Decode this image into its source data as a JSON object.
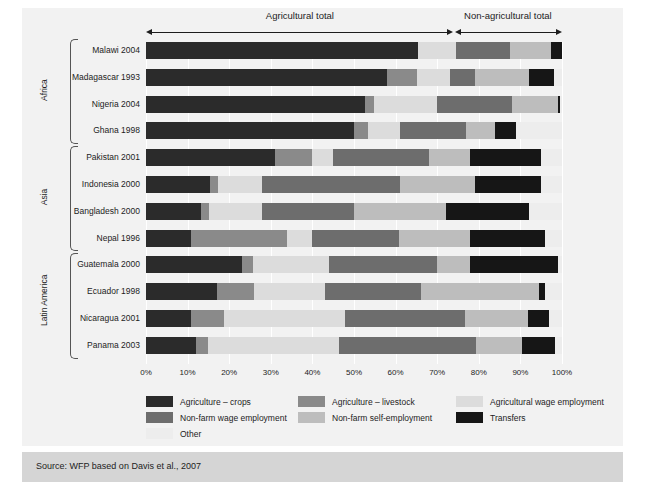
{
  "header": {
    "agricultural_label": "Agricultural total",
    "nonagricultural_label": "Non-agricultural total",
    "split_pct": 74
  },
  "regions": [
    {
      "label": "Africa",
      "start": 0,
      "count": 4
    },
    {
      "label": "Asia",
      "start": 4,
      "count": 4
    },
    {
      "label": "Latin America",
      "start": 8,
      "count": 4
    }
  ],
  "legend": [
    {
      "label": "Agriculture – crops",
      "color": "#2b2b2b",
      "col": 0,
      "row": 0
    },
    {
      "label": "Agriculture – livestock",
      "color": "#8a8a8a",
      "col": 1,
      "row": 0
    },
    {
      "label": "Agricultural wage employment",
      "color": "#dcdcdc",
      "col": 2,
      "row": 0
    },
    {
      "label": "Non-farm wage employment",
      "color": "#6d6d6d",
      "col": 0,
      "row": 1
    },
    {
      "label": "Non-farm self-employment",
      "color": "#bdbdbd",
      "col": 1,
      "row": 1
    },
    {
      "label": "Transfers",
      "color": "#161616",
      "col": 2,
      "row": 1
    },
    {
      "label": "Other",
      "color": "#ededed",
      "col": 0,
      "row": 2
    }
  ],
  "source": "Source: WFP based on Davis et al., 2007",
  "chart_data": {
    "type": "bar",
    "orientation": "horizontal",
    "stacked": true,
    "normalized": true,
    "title": "",
    "xlabel": "",
    "ylabel": "",
    "xlim": [
      0,
      100
    ],
    "grid": true,
    "legend_position": "bottom",
    "xticks": [
      "0%",
      "10%",
      "20%",
      "30%",
      "40%",
      "50%",
      "60%",
      "70%",
      "80%",
      "90%",
      "100%"
    ],
    "xtick_values": [
      0,
      10,
      20,
      30,
      40,
      50,
      60,
      70,
      80,
      90,
      100
    ],
    "categories": [
      "Malawi 2004",
      "Madagascar 1993",
      "Nigeria 2004",
      "Ghana 1998",
      "Pakistan 2001",
      "Indonesia 2000",
      "Bangladesh 2000",
      "Nepal 1996",
      "Guatemala 2000",
      "Ecuador 1998",
      "Nicaragua 2001",
      "Panama 2003"
    ],
    "series": [
      {
        "name": "Agriculture – crops",
        "color": "#2b2b2b",
        "values": [
          65.4,
          58.0,
          52.6,
          50.0,
          31.0,
          15.4,
          13.2,
          10.8,
          23.0,
          17.0,
          10.8,
          12.0
        ]
      },
      {
        "name": "Agriculture – livestock",
        "color": "#8a8a8a",
        "values": [
          0.0,
          7.2,
          2.2,
          3.4,
          9.0,
          2.0,
          2.0,
          23.0,
          2.8,
          9.0,
          8.0,
          2.8
        ]
      },
      {
        "name": "Agricultural wage employment",
        "color": "#dcdcdc",
        "values": [
          9.1,
          7.8,
          15.2,
          7.6,
          5.0,
          10.6,
          12.8,
          6.0,
          18.2,
          17.0,
          29.0,
          31.5
        ]
      },
      {
        "name": "Non-farm wage employment",
        "color": "#6d6d6d",
        "values": [
          13.0,
          6.0,
          18.0,
          16.0,
          23.0,
          33.0,
          22.0,
          21.0,
          26.0,
          23.0,
          29.0,
          33.0
        ]
      },
      {
        "name": "Non-farm self-employment",
        "color": "#bdbdbd",
        "values": [
          9.9,
          13.0,
          11.0,
          7.0,
          10.0,
          18.0,
          22.0,
          17.0,
          8.0,
          28.5,
          15.0,
          11.0
        ]
      },
      {
        "name": "Transfers",
        "color": "#161616",
        "values": [
          2.6,
          6.0,
          0.5,
          5.0,
          17.0,
          16.0,
          20.0,
          18.0,
          21.0,
          1.5,
          5.0,
          8.0
        ]
      },
      {
        "name": "Other",
        "color": "#ededed",
        "values": [
          0.0,
          2.0,
          0.5,
          11.0,
          5.0,
          5.0,
          8.0,
          4.2,
          1.0,
          4.0,
          3.2,
          1.7
        ]
      }
    ]
  }
}
